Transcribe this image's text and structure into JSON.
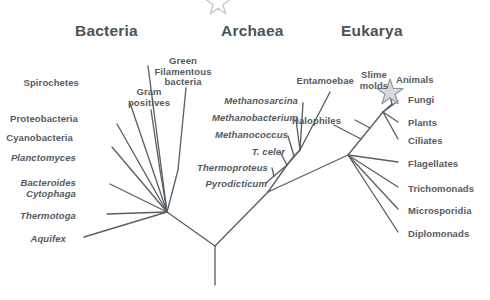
{
  "figure": {
    "background_color": "#ffffff",
    "line_color": "#5a6066",
    "label_color": "#555b60",
    "title_color": "#4c5257",
    "star_color": "#8f979e"
  },
  "domains": [
    {
      "id": "bacteria",
      "label": "Bacteria",
      "x": 75,
      "y": 22
    },
    {
      "id": "archaea",
      "label": "Archaea",
      "x": 221,
      "y": 22
    },
    {
      "id": "eukarya",
      "label": "Eukarya",
      "x": 341,
      "y": 22
    }
  ],
  "taxa": {
    "bacteria": [
      {
        "id": "spirochetes",
        "label": "Spirochetes",
        "italic": false,
        "align": "right",
        "x": 16,
        "y": 78,
        "w": 63,
        "tip_x": 148,
        "tip_y": 66
      },
      {
        "id": "proteobacteria",
        "label": "Proteobacteria",
        "italic": false,
        "align": "right",
        "x": 0,
        "y": 114,
        "w": 78,
        "tip_x": 130,
        "tip_y": 103
      },
      {
        "id": "cyanobacteria",
        "label": "Cyanobacteria",
        "italic": false,
        "align": "right",
        "x": 0,
        "y": 133,
        "w": 73,
        "tip_x": 117,
        "tip_y": 124
      },
      {
        "id": "planctomyces",
        "label": "Planctomyces",
        "italic": true,
        "align": "right",
        "x": 0,
        "y": 153,
        "w": 76,
        "tip_x": 112,
        "tip_y": 147
      },
      {
        "id": "bacteroides",
        "label": "Bacteroides\nCytophaga",
        "italic": true,
        "align": "right",
        "x": 0,
        "y": 178,
        "w": 76,
        "tip_x": 110,
        "tip_y": 184
      },
      {
        "id": "thermotoga",
        "label": "Thermotoga",
        "italic": true,
        "align": "right",
        "x": 0,
        "y": 211,
        "w": 76,
        "tip_x": 107,
        "tip_y": 214
      },
      {
        "id": "aquifex",
        "label": "Aquifex",
        "italic": true,
        "align": "right",
        "x": 0,
        "y": 234,
        "w": 66,
        "tip_x": 84,
        "tip_y": 237
      },
      {
        "id": "gram-positives",
        "label": "Gram\npositives",
        "italic": false,
        "align": "center",
        "x": 125,
        "y": 87,
        "w": 48,
        "tip_x": 151,
        "tip_y": 110
      },
      {
        "id": "green-filamentous",
        "label": "Green\nFilamentous\nbacteria",
        "italic": false,
        "align": "center",
        "x": 148,
        "y": 56,
        "w": 70,
        "tip_x": 186,
        "tip_y": 88
      }
    ],
    "archaea": [
      {
        "id": "methanosarcina",
        "label": "Methanosarcina",
        "italic": true,
        "align": "right",
        "x": 204,
        "y": 96,
        "w": 94,
        "tip_x": 303,
        "tip_y": 103
      },
      {
        "id": "methanobacterium",
        "label": "Methanobacterium",
        "italic": true,
        "align": "right",
        "x": 190,
        "y": 113,
        "w": 108,
        "tip_x": 296,
        "tip_y": 120
      },
      {
        "id": "methanococcus",
        "label": "Methanococcus",
        "italic": true,
        "align": "right",
        "x": 198,
        "y": 130,
        "w": 90,
        "tip_x": 288,
        "tip_y": 136
      },
      {
        "id": "t-celer",
        "label": "T. celer",
        "italic": true,
        "align": "right",
        "x": 230,
        "y": 147,
        "w": 55,
        "tip_x": 280,
        "tip_y": 152
      },
      {
        "id": "thermoproteus",
        "label": "Thermoproteus",
        "italic": true,
        "align": "right",
        "x": 180,
        "y": 163,
        "w": 88,
        "tip_x": 272,
        "tip_y": 168
      },
      {
        "id": "pyrodicticum",
        "label": "Pyrodicticum",
        "italic": true,
        "align": "right",
        "x": 185,
        "y": 179,
        "w": 82,
        "tip_x": 266,
        "tip_y": 183
      },
      {
        "id": "halophiles",
        "label": "Halophiles",
        "italic": false,
        "align": "left",
        "x": 292,
        "y": 116,
        "w": 56,
        "tip_x": 330,
        "tip_y": 92
      }
    ],
    "eukarya": [
      {
        "id": "entamoebae",
        "label": "Entamoebae",
        "italic": false,
        "align": "right",
        "x": 288,
        "y": 76,
        "w": 66,
        "tip_x": 334,
        "tip_y": 125
      },
      {
        "id": "slime-molds",
        "label": "Slime\nmolds",
        "italic": false,
        "align": "center",
        "x": 356,
        "y": 70,
        "w": 36,
        "tip_x": 355,
        "tip_y": 120
      },
      {
        "id": "animals",
        "label": "Animals",
        "italic": false,
        "align": "left",
        "x": 396,
        "y": 75,
        "w": 44,
        "tip_x": 392,
        "tip_y": 104
      },
      {
        "id": "fungi",
        "label": "Fungi",
        "italic": false,
        "align": "left",
        "x": 408,
        "y": 95,
        "w": 40,
        "tip_x": 398,
        "tip_y": 101
      },
      {
        "id": "plants",
        "label": "Plants",
        "italic": false,
        "align": "left",
        "x": 408,
        "y": 118,
        "w": 42,
        "tip_x": 398,
        "tip_y": 122
      },
      {
        "id": "ciliates",
        "label": "Ciliates",
        "italic": false,
        "align": "left",
        "x": 408,
        "y": 136,
        "w": 46,
        "tip_x": 398,
        "tip_y": 139
      },
      {
        "id": "flagellates",
        "label": "Flagellates",
        "italic": false,
        "align": "left",
        "x": 408,
        "y": 159,
        "w": 60,
        "tip_x": 398,
        "tip_y": 162
      },
      {
        "id": "trichomonads",
        "label": "Trichomonads",
        "italic": false,
        "align": "left",
        "x": 408,
        "y": 184,
        "w": 72,
        "tip_x": 398,
        "tip_y": 187
      },
      {
        "id": "microsporidia",
        "label": "Microsporidia",
        "italic": false,
        "align": "left",
        "x": 408,
        "y": 206,
        "w": 74,
        "tip_x": 398,
        "tip_y": 209
      },
      {
        "id": "diplomonads",
        "label": "Diplomonads",
        "italic": false,
        "align": "left",
        "x": 408,
        "y": 229,
        "w": 70,
        "tip_x": 398,
        "tip_y": 232
      }
    ]
  },
  "markers": [
    {
      "id": "animals-star",
      "name": "star-icon",
      "x": 390,
      "y": 87,
      "size": 19,
      "clipped": false
    },
    {
      "id": "top-star-clip",
      "name": "star-icon-clipped",
      "x": 210,
      "y": -8,
      "size": 16,
      "clipped": true
    }
  ],
  "tree_geometry": {
    "root_base": {
      "x": 215,
      "y": 285
    },
    "root_node": {
      "x": 215,
      "y": 246
    },
    "bacteria_node": {
      "x": 167,
      "y": 212
    },
    "archaea_eukarya_node": {
      "x": 268,
      "y": 192
    },
    "archaea_node": {
      "x": 265,
      "y": 190
    },
    "eukarya_node": {
      "x": 348,
      "y": 155
    },
    "eukarya_crown": {
      "x": 383,
      "y": 112
    },
    "archaea_crown": {
      "x": 287,
      "y": 165
    },
    "halophile_node": {
      "x": 300,
      "y": 150
    }
  }
}
